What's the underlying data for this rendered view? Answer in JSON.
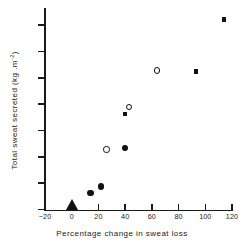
{
  "chart_data": {
    "type": "scatter",
    "title": "",
    "xlabel": "Percentage change in sweat loss",
    "ylabel_text": "Total sweat secreted (kg .m",
    "ylabel_sup": "-2",
    "ylabel_tail": ")",
    "xlim": [
      -20,
      120
    ],
    "ylim": [
      0,
      15
    ],
    "grid": false,
    "legend": "none",
    "xticks": [
      -20,
      0,
      20,
      40,
      60,
      80,
      100,
      120
    ],
    "xtick_labels": [
      "−20",
      "0",
      "20",
      "40",
      "60",
      "80",
      "100",
      "120"
    ],
    "yticks": [
      0,
      2,
      4,
      6,
      8,
      10,
      12,
      14
    ],
    "ytick_labels": [
      "0",
      "2",
      "4",
      "6",
      "8",
      "10",
      "12",
      "14"
    ],
    "series": [
      {
        "name": "filled-circle",
        "marker": "filled-circle",
        "points": [
          {
            "x": 14,
            "y": 1.25
          },
          {
            "x": 22,
            "y": 1.75
          },
          {
            "x": 40,
            "y": 4.65
          }
        ]
      },
      {
        "name": "open-circle",
        "marker": "open-circle",
        "points": [
          {
            "x": 26,
            "y": 4.55
          },
          {
            "x": 43,
            "y": 7.8
          },
          {
            "x": 64,
            "y": 10.55
          }
        ]
      },
      {
        "name": "filled-square",
        "marker": "filled-square",
        "points": [
          {
            "x": 40,
            "y": 7.25
          },
          {
            "x": 93,
            "y": 10.5
          },
          {
            "x": 114,
            "y": 14.45
          }
        ]
      },
      {
        "name": "filled-triangle-origin",
        "marker": "filled-triangle",
        "points": [
          {
            "x": 0,
            "y": 0
          }
        ]
      }
    ]
  }
}
